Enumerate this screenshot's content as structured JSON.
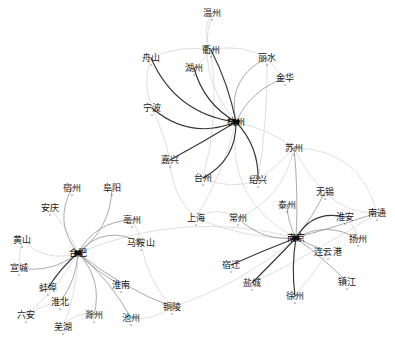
{
  "figure": {
    "type": "network-graph",
    "title": "",
    "background_color": "#ffffff",
    "edge_color_dark": "#2b2b2b",
    "edge_color_mid": "#8a8a8a",
    "edge_color_light": "#c9c9c9",
    "label_color": "#1a1a1a"
  },
  "chart_data": {
    "type": "scatter",
    "title": "",
    "xlabel": "",
    "ylabel": "",
    "grid": false,
    "legend": "none",
    "clusters": [
      {
        "name": "zhejiang",
        "hub": "杭州",
        "members": [
          "温州",
          "衢州",
          "丽水",
          "舟山",
          "湖州",
          "金华",
          "宁波",
          "嘉兴",
          "台州",
          "绍兴"
        ]
      },
      {
        "name": "anhui",
        "hub": "合肥",
        "members": [
          "宿州",
          "阜阳",
          "安庆",
          "亳州",
          "黄山",
          "马鞍山",
          "宣城",
          "蚌埠",
          "淮南",
          "淮北",
          "六安",
          "滁州",
          "池州",
          "芜湖",
          "铜陵"
        ]
      },
      {
        "name": "jiangsu",
        "hub": "南京",
        "members": [
          "苏州",
          "无锡",
          "泰州",
          "南通",
          "淮安",
          "扬州",
          "连云港",
          "镇江",
          "徐州",
          "盐城",
          "宿迁",
          "常州",
          "上海"
        ]
      }
    ],
    "nodes": [
      {
        "id": "wenzhou",
        "label": "温州",
        "x": 212,
        "y": 13,
        "hub": false,
        "cluster": "zhejiang"
      },
      {
        "id": "quzhou",
        "label": "衢州",
        "x": 211,
        "y": 50,
        "hub": false,
        "cluster": "zhejiang"
      },
      {
        "id": "lishui",
        "label": "丽水",
        "x": 267,
        "y": 58,
        "hub": false,
        "cluster": "zhejiang"
      },
      {
        "id": "zhoushan",
        "label": "舟山",
        "x": 151,
        "y": 58,
        "hub": false,
        "cluster": "zhejiang"
      },
      {
        "id": "huzhou",
        "label": "湖州",
        "x": 194,
        "y": 68,
        "hub": false,
        "cluster": "zhejiang"
      },
      {
        "id": "jinhua",
        "label": "金华",
        "x": 285,
        "y": 78,
        "hub": false,
        "cluster": "zhejiang"
      },
      {
        "id": "ningbo",
        "label": "宁波",
        "x": 152,
        "y": 108,
        "hub": false,
        "cluster": "zhejiang"
      },
      {
        "id": "hangzhou",
        "label": "杭州",
        "x": 236,
        "y": 122,
        "hub": true,
        "cluster": "zhejiang"
      },
      {
        "id": "jiaxing",
        "label": "嘉兴",
        "x": 170,
        "y": 160,
        "hub": false,
        "cluster": "zhejiang"
      },
      {
        "id": "taizhou_zj",
        "label": "台州",
        "x": 203,
        "y": 178,
        "hub": false,
        "cluster": "zhejiang"
      },
      {
        "id": "shaoxing",
        "label": "绍兴",
        "x": 258,
        "y": 180,
        "hub": false,
        "cluster": "zhejiang"
      },
      {
        "id": "suzhou",
        "label": "苏州",
        "x": 294,
        "y": 148,
        "hub": false,
        "cluster": "jiangsu"
      },
      {
        "id": "wuxi",
        "label": "无锡",
        "x": 325,
        "y": 192,
        "hub": false,
        "cluster": "jiangsu"
      },
      {
        "id": "taizhou_js",
        "label": "泰州",
        "x": 287,
        "y": 205,
        "hub": false,
        "cluster": "jiangsu"
      },
      {
        "id": "nantong",
        "label": "南通",
        "x": 377,
        "y": 213,
        "hub": false,
        "cluster": "jiangsu"
      },
      {
        "id": "huaian",
        "label": "淮安",
        "x": 345,
        "y": 217,
        "hub": false,
        "cluster": "jiangsu"
      },
      {
        "id": "yangzhou",
        "label": "扬州",
        "x": 358,
        "y": 239,
        "hub": false,
        "cluster": "jiangsu"
      },
      {
        "id": "nanjing",
        "label": "南京",
        "x": 296,
        "y": 238,
        "hub": true,
        "cluster": "jiangsu"
      },
      {
        "id": "lianyun",
        "label": "连云港",
        "x": 328,
        "y": 252,
        "hub": false,
        "cluster": "jiangsu"
      },
      {
        "id": "zhenjiang",
        "label": "镇江",
        "x": 347,
        "y": 282,
        "hub": false,
        "cluster": "jiangsu"
      },
      {
        "id": "suqian",
        "label": "宿迁",
        "x": 231,
        "y": 265,
        "hub": false,
        "cluster": "jiangsu"
      },
      {
        "id": "yancheng",
        "label": "盐城",
        "x": 252,
        "y": 283,
        "hub": false,
        "cluster": "jiangsu"
      },
      {
        "id": "xuzhou",
        "label": "徐州",
        "x": 295,
        "y": 296,
        "hub": false,
        "cluster": "jiangsu"
      },
      {
        "id": "changzhou",
        "label": "常州",
        "x": 238,
        "y": 218,
        "hub": false,
        "cluster": "jiangsu"
      },
      {
        "id": "shanghai",
        "label": "上海",
        "x": 196,
        "y": 218,
        "hub": false,
        "cluster": "jiangsu"
      },
      {
        "id": "suzhou_ah",
        "label": "宿州",
        "x": 72,
        "y": 188,
        "hub": false,
        "cluster": "anhui"
      },
      {
        "id": "fuyang",
        "label": "阜阳",
        "x": 112,
        "y": 188,
        "hub": false,
        "cluster": "anhui"
      },
      {
        "id": "anqing",
        "label": "安庆",
        "x": 50,
        "y": 208,
        "hub": false,
        "cluster": "anhui"
      },
      {
        "id": "bozhou",
        "label": "亳州",
        "x": 132,
        "y": 220,
        "hub": false,
        "cluster": "anhui"
      },
      {
        "id": "huangshan",
        "label": "黄山",
        "x": 22,
        "y": 240,
        "hub": false,
        "cluster": "anhui"
      },
      {
        "id": "maanshan",
        "label": "马鞍山",
        "x": 141,
        "y": 243,
        "hub": false,
        "cluster": "anhui"
      },
      {
        "id": "hefei",
        "label": "合肥",
        "x": 78,
        "y": 253,
        "hub": true,
        "cluster": "anhui"
      },
      {
        "id": "xuancheng",
        "label": "宣城",
        "x": 19,
        "y": 268,
        "hub": false,
        "cluster": "anhui"
      },
      {
        "id": "bengbu",
        "label": "蚌埠",
        "x": 48,
        "y": 288,
        "hub": false,
        "cluster": "anhui"
      },
      {
        "id": "huainan",
        "label": "淮南",
        "x": 121,
        "y": 285,
        "hub": false,
        "cluster": "anhui"
      },
      {
        "id": "huaibei",
        "label": "淮北",
        "x": 60,
        "y": 302,
        "hub": false,
        "cluster": "anhui"
      },
      {
        "id": "luan",
        "label": "六安",
        "x": 26,
        "y": 315,
        "hub": false,
        "cluster": "anhui"
      },
      {
        "id": "chuzhou",
        "label": "滁州",
        "x": 94,
        "y": 315,
        "hub": false,
        "cluster": "anhui"
      },
      {
        "id": "chizhou",
        "label": "池州",
        "x": 131,
        "y": 318,
        "hub": false,
        "cluster": "anhui"
      },
      {
        "id": "wuhu",
        "label": "芜湖",
        "x": 63,
        "y": 327,
        "hub": false,
        "cluster": "anhui"
      },
      {
        "id": "tongling",
        "label": "铜陵",
        "x": 172,
        "y": 307,
        "hub": false,
        "cluster": "anhui"
      }
    ],
    "edges": [
      {
        "from": "hangzhou",
        "to": "wenzhou",
        "w": "light"
      },
      {
        "from": "hangzhou",
        "to": "quzhou",
        "w": "dark"
      },
      {
        "from": "hangzhou",
        "to": "lishui",
        "w": "mid"
      },
      {
        "from": "hangzhou",
        "to": "zhoushan",
        "w": "dark"
      },
      {
        "from": "hangzhou",
        "to": "huzhou",
        "w": "dark"
      },
      {
        "from": "hangzhou",
        "to": "jinhua",
        "w": "mid"
      },
      {
        "from": "hangzhou",
        "to": "ningbo",
        "w": "dark"
      },
      {
        "from": "hangzhou",
        "to": "jiaxing",
        "w": "dark"
      },
      {
        "from": "hangzhou",
        "to": "taizhou_zj",
        "w": "dark"
      },
      {
        "from": "hangzhou",
        "to": "shaoxing",
        "w": "dark"
      },
      {
        "from": "hangzhou",
        "to": "suzhou",
        "w": "light"
      },
      {
        "from": "hangzhou",
        "to": "shanghai",
        "w": "light"
      },
      {
        "from": "hangzhou",
        "to": "nanjing",
        "w": "light"
      },
      {
        "from": "quzhou",
        "to": "wenzhou",
        "w": "light"
      },
      {
        "from": "quzhou",
        "to": "zhoushan",
        "w": "light"
      },
      {
        "from": "quzhou",
        "to": "lishui",
        "w": "light"
      },
      {
        "from": "quzhou",
        "to": "huzhou",
        "w": "light"
      },
      {
        "from": "quzhou",
        "to": "taizhou_zj",
        "w": "light"
      },
      {
        "from": "lishui",
        "to": "jinhua",
        "w": "light"
      },
      {
        "from": "lishui",
        "to": "shaoxing",
        "w": "light"
      },
      {
        "from": "ningbo",
        "to": "jiaxing",
        "w": "light"
      },
      {
        "from": "ningbo",
        "to": "zhoushan",
        "w": "light"
      },
      {
        "from": "nanjing",
        "to": "suzhou",
        "w": "mid"
      },
      {
        "from": "nanjing",
        "to": "wuxi",
        "w": "mid"
      },
      {
        "from": "nanjing",
        "to": "taizhou_js",
        "w": "mid"
      },
      {
        "from": "nanjing",
        "to": "nantong",
        "w": "mid"
      },
      {
        "from": "nanjing",
        "to": "huaian",
        "w": "dark"
      },
      {
        "from": "nanjing",
        "to": "yangzhou",
        "w": "mid"
      },
      {
        "from": "nanjing",
        "to": "lianyun",
        "w": "mid"
      },
      {
        "from": "nanjing",
        "to": "zhenjiang",
        "w": "mid"
      },
      {
        "from": "nanjing",
        "to": "suqian",
        "w": "dark"
      },
      {
        "from": "nanjing",
        "to": "yancheng",
        "w": "dark"
      },
      {
        "from": "nanjing",
        "to": "xuzhou",
        "w": "dark"
      },
      {
        "from": "nanjing",
        "to": "changzhou",
        "w": "mid"
      },
      {
        "from": "nanjing",
        "to": "shanghai",
        "w": "light"
      },
      {
        "from": "suzhou",
        "to": "wuxi",
        "w": "light"
      },
      {
        "from": "suzhou",
        "to": "nantong",
        "w": "light"
      },
      {
        "from": "suzhou",
        "to": "changzhou",
        "w": "light"
      },
      {
        "from": "wuxi",
        "to": "nantong",
        "w": "light"
      },
      {
        "from": "huaian",
        "to": "yangzhou",
        "w": "light"
      },
      {
        "from": "xuzhou",
        "to": "lianyun",
        "w": "light"
      },
      {
        "from": "yancheng",
        "to": "nantong",
        "w": "light"
      },
      {
        "from": "hefei",
        "to": "suzhou_ah",
        "w": "mid"
      },
      {
        "from": "hefei",
        "to": "fuyang",
        "w": "mid"
      },
      {
        "from": "hefei",
        "to": "anqing",
        "w": "light"
      },
      {
        "from": "hefei",
        "to": "bozhou",
        "w": "mid"
      },
      {
        "from": "hefei",
        "to": "huangshan",
        "w": "light"
      },
      {
        "from": "hefei",
        "to": "maanshan",
        "w": "mid"
      },
      {
        "from": "hefei",
        "to": "xuancheng",
        "w": "mid"
      },
      {
        "from": "hefei",
        "to": "bengbu",
        "w": "dark"
      },
      {
        "from": "hefei",
        "to": "huainan",
        "w": "mid"
      },
      {
        "from": "hefei",
        "to": "huaibei",
        "w": "mid"
      },
      {
        "from": "hefei",
        "to": "luan",
        "w": "light"
      },
      {
        "from": "hefei",
        "to": "chuzhou",
        "w": "mid"
      },
      {
        "from": "hefei",
        "to": "chizhou",
        "w": "mid"
      },
      {
        "from": "hefei",
        "to": "wuhu",
        "w": "light"
      },
      {
        "from": "hefei",
        "to": "tongling",
        "w": "mid"
      },
      {
        "from": "hefei",
        "to": "nanjing",
        "w": "light"
      },
      {
        "from": "maanshan",
        "to": "tongling",
        "w": "light"
      },
      {
        "from": "bozhou",
        "to": "maanshan",
        "w": "light"
      },
      {
        "from": "tongling",
        "to": "nanjing",
        "w": "light"
      },
      {
        "from": "huangshan",
        "to": "xuancheng",
        "w": "light"
      },
      {
        "from": "shanghai",
        "to": "changzhou",
        "w": "light"
      },
      {
        "from": "jiaxing",
        "to": "shanghai",
        "w": "light"
      },
      {
        "from": "shaoxing",
        "to": "taizhou_zj",
        "w": "light"
      },
      {
        "from": "shaoxing",
        "to": "suzhou",
        "w": "light"
      },
      {
        "from": "tongling",
        "to": "chizhou",
        "w": "light"
      },
      {
        "from": "wuhu",
        "to": "chuzhou",
        "w": "light"
      },
      {
        "from": "luan",
        "to": "huaibei",
        "w": "light"
      }
    ]
  }
}
